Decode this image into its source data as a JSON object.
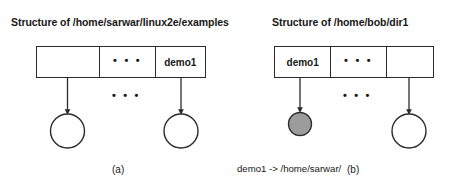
{
  "figure": {
    "caption_a": "(a)",
    "caption_b": "(b)",
    "ellipsis": "• • •",
    "colors": {
      "stroke": "#2b2b2b",
      "text": "#171717",
      "background": "#ffffff",
      "shaded_inode_fill": "#9c9c9c"
    }
  },
  "panel_a": {
    "title": "Structure of /home/sarwar/linux2e/examples",
    "directory_cells": [
      "",
      "• • •",
      "demo1"
    ],
    "mid_ellipsis": "• • •",
    "inodes": [
      {
        "name": "inode-empty-left",
        "shaded": false
      },
      {
        "name": "inode-demo1-target",
        "shaded": false
      }
    ],
    "label": "(a)"
  },
  "panel_b": {
    "title": "Structure of /home/bob/dir1",
    "directory_cells": [
      "demo1",
      "• • •",
      ""
    ],
    "mid_ellipsis": "• • •",
    "inodes": [
      {
        "name": "inode-symlink-demo1",
        "shaded": true
      },
      {
        "name": "inode-empty-right",
        "shaded": false
      }
    ],
    "link_caption_line1": "demo1 -> /home/sarwar/",
    "link_caption_line2": "linux2e/examples/demo1",
    "label": "(b)"
  }
}
